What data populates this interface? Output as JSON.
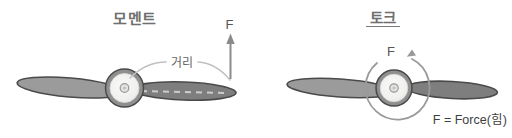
{
  "colors": {
    "background": "#ffffff",
    "title_text": "#6f6f6f",
    "label_text": "#555555",
    "annotation_text": "#666666",
    "caption_text": "#3d3d3d",
    "blade_left_fill": "#9b9b9b",
    "blade_right_fill": "#7e7e7e",
    "blade_outline": "#4a4a4a",
    "hub_ring": "#8f8f8f",
    "hub_face": "#f1f1ef",
    "hub_center": "#e3e3e0",
    "force_arrow": "#8a8a8a",
    "distance_curve": "#c0c0c0",
    "rotation_arrow": "#9a9a9a",
    "blade_dash": "#cccccc"
  },
  "moment_diagram": {
    "title": "모멘트",
    "force_label": "F",
    "distance_label": "거리"
  },
  "torque_diagram": {
    "title": "토크",
    "force_label": "F",
    "caption": "F = Force(힘)"
  }
}
